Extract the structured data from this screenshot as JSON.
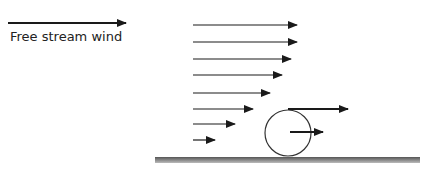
{
  "legend": {
    "label": "Free stream wind"
  },
  "colors": {
    "arrow": "#1a1a1a",
    "ground_top": "#555555",
    "ground_bottom": "#bbbbbb",
    "circle": "#333333"
  },
  "profile_arrows": [
    {
      "y": 25,
      "x1": 193,
      "x2": 297
    },
    {
      "y": 42,
      "x1": 193,
      "x2": 297
    },
    {
      "y": 59,
      "x1": 193,
      "x2": 291
    },
    {
      "y": 75,
      "x1": 193,
      "x2": 282
    },
    {
      "y": 93,
      "x1": 193,
      "x2": 270
    },
    {
      "y": 109,
      "x1": 193,
      "x2": 253
    },
    {
      "y": 124,
      "x1": 193,
      "x2": 235
    },
    {
      "y": 140,
      "x1": 193,
      "x2": 215
    }
  ],
  "cylinder": {
    "cx": 288,
    "cy": 133,
    "r": 23
  },
  "cylinder_top_arrow": {
    "y": 109,
    "x1": 288,
    "x2": 348
  },
  "cylinder_center_arrow": {
    "y": 132,
    "x1": 290,
    "x2": 323
  },
  "legend_arrow": {
    "y": 23,
    "x1": 8,
    "x2": 126
  },
  "ground": {
    "x": 155,
    "y": 157,
    "w": 265,
    "h": 6
  }
}
